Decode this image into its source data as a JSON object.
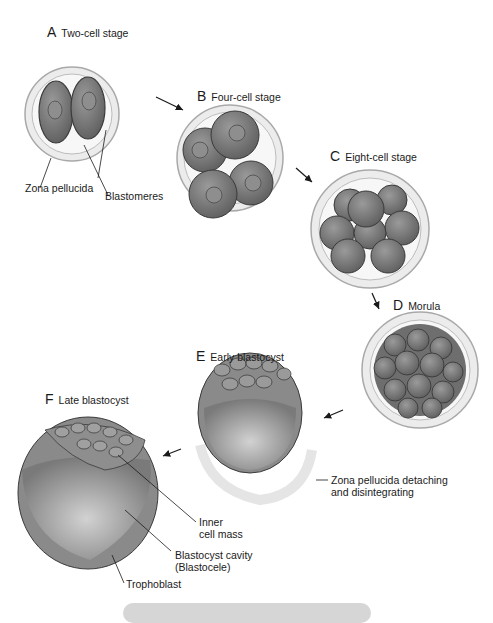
{
  "colors": {
    "cell_fill": "#7e7e7e",
    "cell_stroke": "#3a3a3a",
    "nucleus_fill": "#8e8e8e",
    "zona_fill": "#e9e9e9",
    "zona_stroke": "#a9a9a9",
    "cavity_fill": "#9a9a9a",
    "background": "#ffffff",
    "caption_bar": "#d6d6d6"
  },
  "stages": [
    {
      "letter": "A",
      "name": "Two-cell stage"
    },
    {
      "letter": "B",
      "name": "Four-cell stage"
    },
    {
      "letter": "C",
      "name": "Eight-cell stage"
    },
    {
      "letter": "D",
      "name": "Morula"
    },
    {
      "letter": "E",
      "name": "Early blastocyst"
    },
    {
      "letter": "F",
      "name": "Late blastocyst"
    }
  ],
  "labels": {
    "zona_pellucida": "Zona pellucida",
    "blastomeres": "Blastomeres",
    "zona_detaching_line1": "Zona pellucida detaching",
    "zona_detaching_line2": "and disintegrating",
    "inner_cell_mass_line1": "Inner",
    "inner_cell_mass_line2": "cell mass",
    "blastocyst_cavity_line1": "Blastocyst cavity",
    "blastocyst_cavity_line2": "(Blastocele)",
    "trophoblast": "Trophoblast"
  }
}
